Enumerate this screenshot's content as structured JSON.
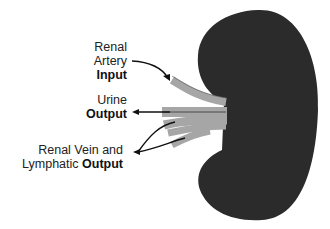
{
  "labels": {
    "artery": {
      "line1": "Renal",
      "line2": "Artery",
      "emph": "Input"
    },
    "urine": {
      "line1": "Urine",
      "emph": "Output"
    },
    "vein": {
      "line1": "Renal Vein and",
      "line2": "Lymphatic",
      "emph": "Output"
    }
  },
  "colors": {
    "kidney": "#2b2b2b",
    "vessel": "#a6a6a6",
    "arrow": "#111111",
    "text": "#222222"
  }
}
